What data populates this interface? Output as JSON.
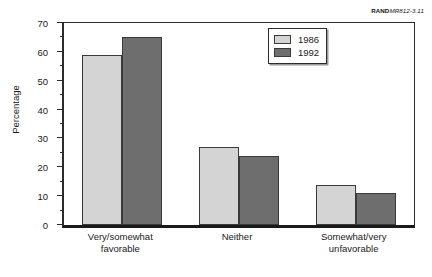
{
  "figure_id": {
    "bold_part": "RAND",
    "italic_part": "MR812-3.11"
  },
  "legend": {
    "position": "top-right-inside",
    "items": [
      {
        "label": "1986",
        "color": "#d4d4d4"
      },
      {
        "label": "1992",
        "color": "#6e6e6e"
      }
    ]
  },
  "chart_data": {
    "type": "bar",
    "title": "",
    "subtitle": "",
    "xlabel": "",
    "ylabel": "Percentage",
    "categories": [
      "Very/somewhat\nfavorable",
      "Neither",
      "Somewhat/very\nunfavorable"
    ],
    "series": [
      {
        "name": "1986",
        "color": "#d4d4d4",
        "values": [
          59,
          27,
          14
        ]
      },
      {
        "name": "1992",
        "color": "#6e6e6e",
        "values": [
          65,
          24,
          11
        ]
      }
    ],
    "ylim": [
      0,
      70
    ],
    "ytick_labels": [
      "0",
      "10",
      "20",
      "30",
      "40",
      "50",
      "60",
      "70"
    ],
    "ytick_values": [
      0,
      10,
      20,
      30,
      40,
      50,
      60,
      70
    ],
    "yminor_tick_values": [
      5,
      15,
      25,
      35,
      45,
      55,
      65
    ],
    "grid": false,
    "legend_position": "upper right"
  }
}
